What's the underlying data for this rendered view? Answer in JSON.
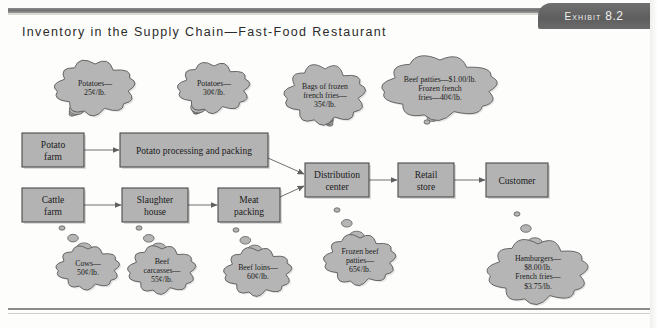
{
  "exhibit": {
    "label": "Exhibit",
    "number": "8.2"
  },
  "title": "Inventory in the Supply Chain—Fast-Food Restaurant",
  "diagram": {
    "type": "supply-chain-flow",
    "nodes": [
      {
        "id": "potato-farm",
        "label_line1": "Potato",
        "label_line2": "farm",
        "x": 22,
        "y": 133,
        "w": 62,
        "h": 34
      },
      {
        "id": "potato-processing",
        "label_line1": "Potato processing and packing",
        "label_line2": "",
        "x": 120,
        "y": 133,
        "w": 148,
        "h": 34
      },
      {
        "id": "cattle-farm",
        "label_line1": "Cattle",
        "label_line2": "farm",
        "x": 22,
        "y": 188,
        "w": 62,
        "h": 34
      },
      {
        "id": "slaughter-house",
        "label_line1": "Slaughter",
        "label_line2": "house",
        "x": 122,
        "y": 188,
        "w": 66,
        "h": 34
      },
      {
        "id": "meat-packing",
        "label_line1": "Meat",
        "label_line2": "packing",
        "x": 218,
        "y": 188,
        "w": 62,
        "h": 34
      },
      {
        "id": "distribution-center",
        "label_line1": "Distribution",
        "label_line2": "center",
        "x": 305,
        "y": 163,
        "w": 64,
        "h": 34
      },
      {
        "id": "retail-store",
        "label_line1": "Retail",
        "label_line2": "store",
        "x": 398,
        "y": 163,
        "w": 56,
        "h": 34
      },
      {
        "id": "customer",
        "label_line1": "Customer",
        "label_line2": "",
        "x": 486,
        "y": 163,
        "w": 62,
        "h": 34
      }
    ],
    "arrows": [
      {
        "id": "arrow-potato-farm-to-processing",
        "from": "potato-farm",
        "to": "potato-processing"
      },
      {
        "id": "arrow-processing-to-distribution",
        "from": "potato-processing",
        "to": "distribution-center"
      },
      {
        "id": "arrow-cattle-to-slaughter",
        "from": "cattle-farm",
        "to": "slaughter-house"
      },
      {
        "id": "arrow-slaughter-to-meat",
        "from": "slaughter-house",
        "to": "meat-packing"
      },
      {
        "id": "arrow-meat-to-distribution",
        "from": "meat-packing",
        "to": "distribution-center"
      },
      {
        "id": "arrow-distribution-to-retail",
        "from": "distribution-center",
        "to": "retail-store"
      },
      {
        "id": "arrow-retail-to-customer",
        "from": "retail-store",
        "to": "customer"
      }
    ],
    "clouds": [
      {
        "id": "cloud-potatoes-25",
        "owner": "potato-farm",
        "lines": [
          "Potatoes—",
          "25¢/lb."
        ],
        "cx": 95,
        "cy": 88,
        "rx": 38,
        "ry": 24,
        "tail_dir": "down-left",
        "tail_x": 72,
        "tail_y": 114
      },
      {
        "id": "cloud-potatoes-30",
        "owner": "potato-processing",
        "lines": [
          "Potatoes—",
          "30¢/lb."
        ],
        "cx": 214,
        "cy": 88,
        "rx": 34,
        "ry": 22,
        "tail_dir": "down-left",
        "tail_x": 196,
        "tail_y": 112
      },
      {
        "id": "cloud-frozen-fries-35",
        "owner": "distribution-center",
        "lines": [
          "Bags of frozen",
          "french fries—",
          "35¢/lb."
        ],
        "cx": 325,
        "cy": 95,
        "rx": 38,
        "ry": 26,
        "tail_dir": "down",
        "tail_x": 330,
        "tail_y": 124
      },
      {
        "id": "cloud-beef-patties-frozen-fries",
        "owner": "retail-store",
        "lines": [
          "Beef patties—$1.00/lb.",
          "Frozen french",
          "fries—40¢/lb."
        ],
        "cx": 440,
        "cy": 88,
        "rx": 56,
        "ry": 28,
        "tail_dir": "down",
        "tail_x": 427,
        "tail_y": 122
      },
      {
        "id": "cloud-cows-50",
        "owner": "cattle-farm",
        "lines": [
          "Cows—",
          "50¢/lb."
        ],
        "cx": 88,
        "cy": 268,
        "rx": 30,
        "ry": 19,
        "tail_dir": "up",
        "tail_x": 62,
        "tail_y": 228
      },
      {
        "id": "cloud-beef-carcasses-55",
        "owner": "slaughter-house",
        "lines": [
          "Beef",
          "carcasses—",
          "55¢/lb."
        ],
        "cx": 162,
        "cy": 270,
        "rx": 32,
        "ry": 21,
        "tail_dir": "up",
        "tail_x": 139,
        "tail_y": 228
      },
      {
        "id": "cloud-beef-loins-60",
        "owner": "meat-packing",
        "lines": [
          "Beef loins—",
          "60¢/lb."
        ],
        "cx": 258,
        "cy": 272,
        "rx": 32,
        "ry": 21,
        "tail_dir": "up",
        "tail_x": 236,
        "tail_y": 230
      },
      {
        "id": "cloud-frozen-beef-patties-65",
        "owner": "distribution-center",
        "lines": [
          "Frozen beef",
          "patties—",
          "65¢/lb."
        ],
        "cx": 360,
        "cy": 260,
        "rx": 34,
        "ry": 22,
        "tail_dir": "up",
        "tail_x": 337,
        "tail_y": 210
      },
      {
        "id": "cloud-hamburgers-french-fries",
        "owner": "customer",
        "lines": [
          "Hamburgers—",
          "$8.00/lb.",
          "French fries—",
          "$3.75/lb."
        ],
        "cx": 538,
        "cy": 272,
        "rx": 48,
        "ry": 28,
        "tail_dir": "up",
        "tail_x": 517,
        "tail_y": 214
      }
    ],
    "colors": {
      "box_fill": "#b3b3b3",
      "box_stroke": "#4a4a4a",
      "cloud_fill": "#b5b5b5",
      "cloud_stroke": "#5a5a5a",
      "arrow": "#707070",
      "exhibit_tab": "#656565",
      "title_text": "#2b2b2b"
    }
  }
}
